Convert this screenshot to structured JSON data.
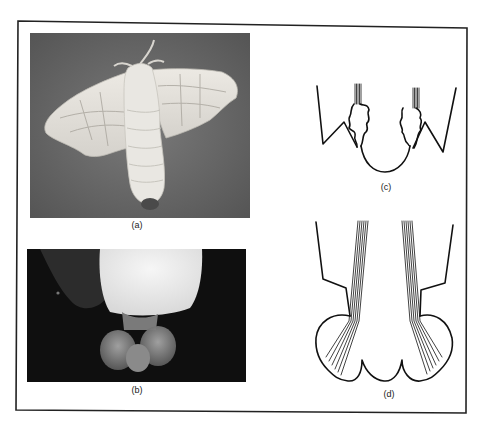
{
  "figure": {
    "panels": [
      {
        "id": "a",
        "label": "(a)",
        "kind": "photograph",
        "subject": "moth-adult-dorsal-view"
      },
      {
        "id": "b",
        "label": "(b)",
        "kind": "photograph",
        "subject": "moth-abdomen-everted-lobes"
      },
      {
        "id": "c",
        "label": "(c)",
        "kind": "line-drawing",
        "subject": "retracted-gland-cross-section"
      },
      {
        "id": "d",
        "label": "(d)",
        "kind": "line-drawing",
        "subject": "everted-gland-cross-section"
      }
    ]
  },
  "colors": {
    "background": "#ffffff",
    "frame": "#222222",
    "photo_a_background": "#6e6e6e",
    "photo_b_background": "#0f0f0f",
    "moth_body": "#e6e4df",
    "line_art": "#111111"
  }
}
